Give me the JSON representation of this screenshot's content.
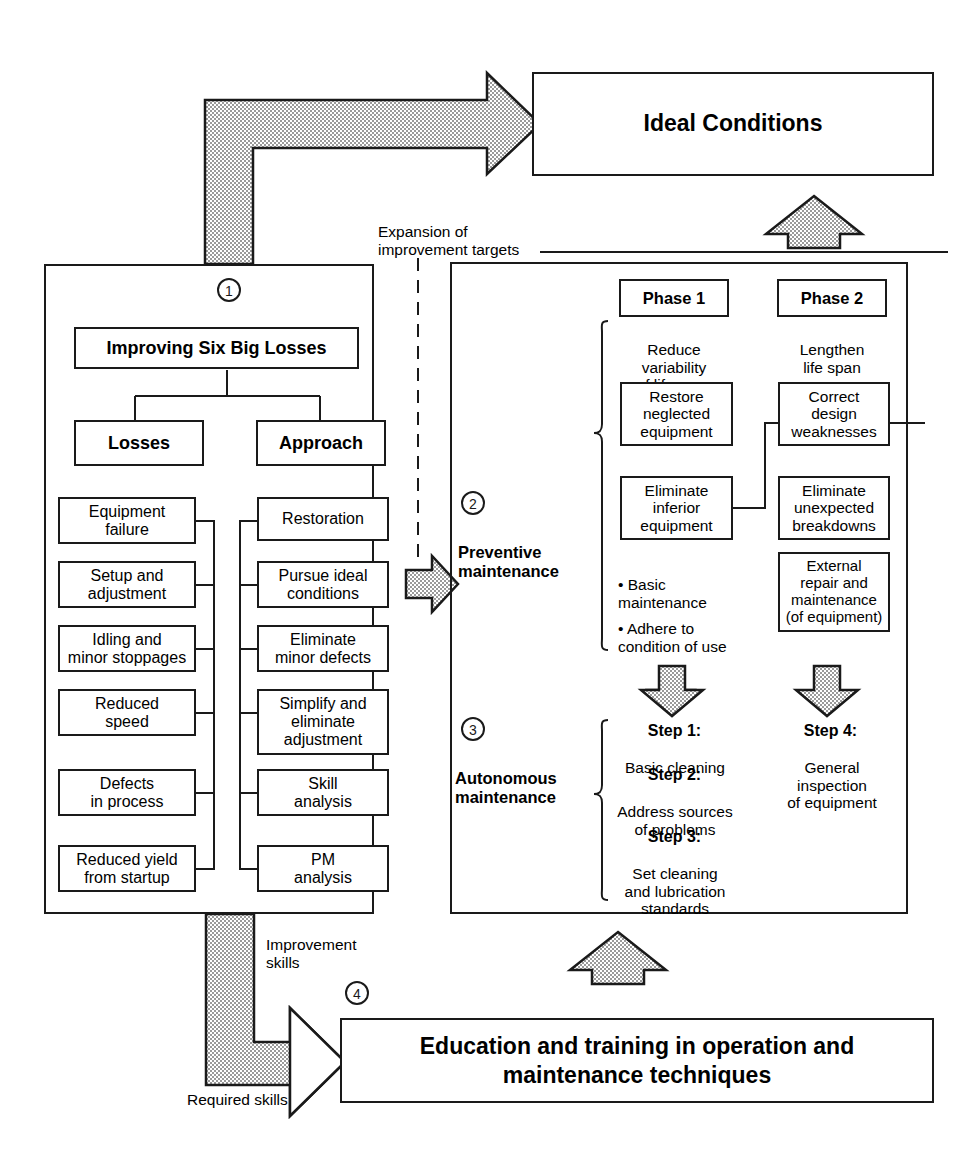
{
  "diagram": {
    "title_top": "Ideal Conditions",
    "bottom_box": "Education and training in operation and maintenance techniques",
    "labels": {
      "expansion": "Expansion of\nimprovement targets",
      "improvement_skills": "Improvement\nskills",
      "required_skills": "Required skills"
    },
    "markers": {
      "one": "①",
      "two": "②",
      "three": "③",
      "four": "④"
    }
  },
  "left_panel": {
    "header": "Improving Six Big Losses",
    "col_losses_header": "Losses",
    "col_approach_header": "Approach",
    "losses": [
      "Equipment\nfailure",
      "Setup and\nadjustment",
      "Idling and\nminor stoppages",
      "Reduced\nspeed",
      "Defects\nin process",
      "Reduced yield\nfrom startup"
    ],
    "approaches": [
      "Restoration",
      "Pursue ideal\nconditions",
      "Eliminate\nminor defects",
      "Simplify and\neliminate\nadjustment",
      "Skill\nanalysis",
      "PM\nanalysis"
    ]
  },
  "right_panel": {
    "preventive": {
      "label": "Preventive\nmaintenance",
      "phase1_header": "Phase 1",
      "phase2_header": "Phase 2",
      "phase1_caption": "Reduce\nvariability\nof life span",
      "phase2_caption": "Lengthen\nlife span",
      "phase1_boxes": [
        "Restore\nneglected\nequipment",
        "Eliminate\ninferior\nequipment"
      ],
      "phase2_boxes": [
        "Correct\ndesign\nweaknesses",
        "Eliminate\nunexpected\nbreakdowns",
        "External\nrepair and\nmaintenance\n(of equipment)"
      ],
      "bullets": [
        "• Basic\n   maintenance",
        "• Adhere to\n   condition of use"
      ]
    },
    "autonomous": {
      "label": "Autonomous\nmaintenance",
      "steps_left": [
        {
          "title": "Step 1:",
          "body": "Basic cleaning"
        },
        {
          "title": "Step 2:",
          "body": "Address sources\nof problems"
        },
        {
          "title": "Step 3:",
          "body": "Set cleaning\nand lubrication\nstandards"
        }
      ],
      "steps_right": [
        {
          "title": "Step 4:",
          "body": "General\ninspection\nof equipment"
        }
      ]
    }
  },
  "colors": {
    "ink": "#1a1a1a",
    "paper": "#ffffff",
    "fill": "#d8d8d8"
  }
}
